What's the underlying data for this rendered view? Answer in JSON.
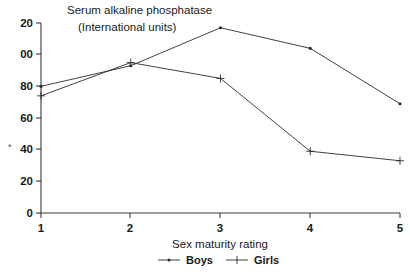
{
  "chart_data": {
    "type": "line",
    "title": "Serum alkaline phosphatase",
    "subtitle": "(International units)",
    "xlabel": "Sex maturity rating",
    "ylabel": "",
    "x": [
      1,
      2,
      3,
      4,
      5
    ],
    "categories": [
      "1",
      "2",
      "3",
      "4",
      "5"
    ],
    "series": [
      {
        "name": "Boys",
        "marker": "dot",
        "values": [
          80,
          93,
          117,
          104,
          69
        ]
      },
      {
        "name": "Girls",
        "marker": "cross",
        "values": [
          74,
          95,
          85,
          39,
          33
        ]
      }
    ],
    "xlim": [
      1,
      5
    ],
    "ylim": [
      0,
      120
    ],
    "yticks": [
      0,
      20,
      40,
      60,
      80,
      100,
      120
    ],
    "ytick_labels": [
      "0",
      "20",
      "40",
      "60",
      "80",
      "00",
      "20"
    ],
    "xticks": [
      1,
      2,
      3,
      4,
      5
    ],
    "grid": false,
    "legend_position": "bottom",
    "note_left_cropped": "Leading digit of 100 and 120 is cut off at the left image edge",
    "stray_mark": "*"
  },
  "colors": {
    "line": "#2b2b2b",
    "axis": "#3a3a3a",
    "text": "#1a1a1a",
    "background": "#ffffff"
  },
  "legend": {
    "items": [
      {
        "label": "Boys"
      },
      {
        "label": "Girls"
      }
    ]
  }
}
